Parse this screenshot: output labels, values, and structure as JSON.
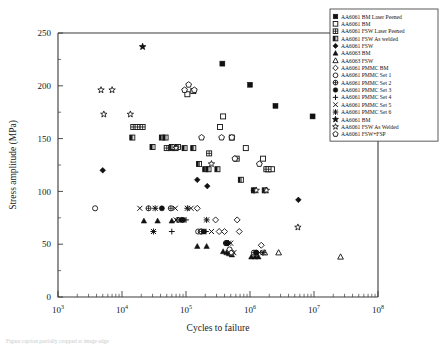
{
  "chart_data": {
    "type": "scatter",
    "title": "",
    "xlabel": "Cycles to failure",
    "ylabel": "Stress amplitude (MPa)",
    "xscale": "log",
    "xlim": [
      1000,
      100000000
    ],
    "ylim": [
      0,
      250
    ],
    "yticks": [
      0,
      50,
      100,
      150,
      200,
      250
    ],
    "yticks_minor": [
      25,
      75,
      125,
      175,
      225
    ],
    "xticks": [
      "10^3",
      "10^4",
      "10^5",
      "10^6",
      "10^7",
      "10^8"
    ],
    "xtick_labels": [
      "10",
      "10",
      "10",
      "10",
      "10",
      "10"
    ],
    "xtick_exponents": [
      "3",
      "4",
      "5",
      "6",
      "7",
      "8"
    ],
    "grid": false,
    "legend_position": "top-right-outside",
    "series": [
      {
        "name": "AA6061 BM Laser Peened",
        "marker": "filled-square",
        "points": [
          [
            370000,
            221
          ],
          [
            1000000,
            201
          ],
          [
            2500000,
            181
          ],
          [
            9500000,
            171
          ]
        ]
      },
      {
        "name": "AA6061 BM",
        "marker": "open-square",
        "points": [
          [
            105000,
            192
          ],
          [
            130000,
            195
          ],
          [
            380000,
            171
          ],
          [
            340000,
            161
          ],
          [
            520000,
            151
          ],
          [
            860000,
            141
          ],
          [
            1600000,
            131
          ],
          [
            1900000,
            121
          ],
          [
            2200000,
            121
          ]
        ]
      },
      {
        "name": "AA6061 FSW Laser Peened",
        "marker": "crosshatch-square",
        "points": [
          [
            15000,
            161
          ],
          [
            17500,
            161
          ],
          [
            21000,
            161
          ],
          [
            50000,
            141
          ],
          [
            58000,
            141
          ],
          [
            68000,
            141
          ],
          [
            230000,
            136
          ],
          [
            620000,
            131
          ],
          [
            1800000,
            121
          ],
          [
            1950000,
            121
          ]
        ]
      },
      {
        "name": "AA6061 FSW As welded",
        "marker": "half-filled-square",
        "points": [
          [
            14500,
            151
          ],
          [
            30000,
            142
          ],
          [
            42000,
            151
          ],
          [
            48000,
            151
          ],
          [
            60000,
            142
          ],
          [
            75000,
            142
          ],
          [
            95000,
            141
          ],
          [
            130000,
            141
          ],
          [
            160000,
            126
          ],
          [
            200000,
            121
          ],
          [
            225000,
            121
          ],
          [
            310000,
            121
          ],
          [
            720000,
            111
          ],
          [
            1150000,
            101
          ],
          [
            1700000,
            101
          ]
        ]
      },
      {
        "name": "AA6061 FSW",
        "marker": "filled-diamond",
        "points": [
          [
            5000,
            120
          ],
          [
            150000,
            111
          ],
          [
            215000,
            105
          ],
          [
            1150000,
            101
          ],
          [
            5700000,
            92
          ]
        ]
      },
      {
        "name": "AA6063 BM",
        "marker": "filled-triangle",
        "points": [
          [
            22000,
            72
          ],
          [
            36000,
            72
          ],
          [
            60000,
            72
          ],
          [
            150000,
            48
          ],
          [
            210000,
            48
          ],
          [
            380000,
            43
          ],
          [
            430000,
            42
          ],
          [
            470000,
            41
          ],
          [
            520000,
            40
          ],
          [
            1050000,
            38
          ],
          [
            1200000,
            38
          ],
          [
            1350000,
            38
          ]
        ]
      },
      {
        "name": "AA6063 FSW",
        "marker": "open-triangle",
        "points": [
          [
            1700000,
            42
          ],
          [
            2800000,
            42
          ],
          [
            26000000,
            38
          ]
        ]
      },
      {
        "name": "AA6061 PMMC BM",
        "marker": "open-diamond",
        "points": [
          [
            150000,
            84
          ],
          [
            630000,
            73
          ],
          [
            680000,
            62
          ],
          [
            1500000,
            49
          ],
          [
            290000,
            73
          ],
          [
            330000,
            62
          ],
          [
            400000,
            62
          ]
        ]
      },
      {
        "name": "AA6061 PMMC Set 1",
        "marker": "open-circle",
        "points": [
          [
            3800,
            84
          ],
          [
            155000,
            62
          ],
          [
            170000,
            62
          ],
          [
            440000,
            51
          ],
          [
            480000,
            45
          ],
          [
            520000,
            42
          ],
          [
            1250000,
            42
          ]
        ]
      },
      {
        "name": "AA6061 PMMC Set 2",
        "marker": "crosshatch-circle",
        "points": [
          [
            26000,
            84
          ],
          [
            58000,
            84
          ],
          [
            75000,
            73
          ],
          [
            175000,
            62
          ],
          [
            420000,
            51
          ],
          [
            1150000,
            42
          ]
        ]
      },
      {
        "name": "AA6061 PMMC Set 3",
        "marker": "filled-circle",
        "points": [
          [
            42000,
            84
          ],
          [
            85000,
            73
          ],
          [
            90000,
            73
          ],
          [
            190000,
            62
          ],
          [
            430000,
            51
          ],
          [
            1250000,
            42
          ]
        ]
      },
      {
        "name": "AA6061 PMMC Set 4",
        "marker": "plus",
        "points": [
          [
            100000,
            73
          ],
          [
            60000,
            62
          ],
          [
            205000,
            62
          ],
          [
            450000,
            51
          ]
        ]
      },
      {
        "name": "AA6061 PMMC Set 5",
        "marker": "cross-x",
        "points": [
          [
            19000,
            84
          ],
          [
            70000,
            73
          ],
          [
            68000,
            84
          ],
          [
            120000,
            84
          ],
          [
            250000,
            62
          ],
          [
            500000,
            51
          ],
          [
            560000,
            42
          ],
          [
            1400000,
            42
          ]
        ]
      },
      {
        "name": "AA6061 PMMC Set 6",
        "marker": "asterisk",
        "points": [
          [
            33000,
            84
          ],
          [
            105000,
            84
          ],
          [
            31000,
            62
          ],
          [
            210000,
            73
          ],
          [
            460000,
            51
          ],
          [
            1600000,
            42
          ]
        ]
      },
      {
        "name": "AA6061 BM",
        "marker": "filled-star",
        "points": [
          [
            21000,
            237
          ]
        ]
      },
      {
        "name": "AA6061 FSW As Welded",
        "marker": "open-star",
        "points": [
          [
            4700,
            196
          ],
          [
            7000,
            196
          ],
          [
            5200,
            173
          ],
          [
            13500,
            173
          ],
          [
            70000,
            141
          ],
          [
            250000,
            126
          ],
          [
            1250000,
            101
          ],
          [
            1800000,
            101
          ],
          [
            5600000,
            66
          ]
        ]
      },
      {
        "name": "AA6061 FSW+FSP",
        "marker": "open-pentagon",
        "points": [
          [
            95000,
            196
          ],
          [
            110000,
            201
          ],
          [
            135000,
            196
          ],
          [
            175000,
            151
          ],
          [
            360000,
            151
          ],
          [
            520000,
            151
          ],
          [
            1400000,
            126
          ],
          [
            580000,
            131
          ]
        ]
      }
    ]
  },
  "legend": {
    "items": [
      {
        "marker": "filled-square",
        "label": "AA6061 BM Laser Peened"
      },
      {
        "marker": "open-square",
        "label": "AA6061 BM"
      },
      {
        "marker": "crosshatch-square",
        "label": "AA6061 FSW Laser Peened"
      },
      {
        "marker": "half-filled-square",
        "label": "AA6061 FSW As welded"
      },
      {
        "marker": "filled-diamond",
        "label": "AA6061 FSW"
      },
      {
        "marker": "filled-triangle",
        "label": "AA6063 BM"
      },
      {
        "marker": "open-triangle",
        "label": "AA6063 FSW"
      },
      {
        "marker": "open-diamond",
        "label": "AA6061 PMMC BM"
      },
      {
        "marker": "open-circle",
        "label": "AA6061 PMMC Set 1"
      },
      {
        "marker": "crosshatch-circle",
        "label": "AA6061 PMMC Set 2"
      },
      {
        "marker": "filled-circle",
        "label": "AA6061 PMMC Set 3"
      },
      {
        "marker": "plus",
        "label": "AA6061 PMMC Set 4"
      },
      {
        "marker": "cross-x",
        "label": "AA6061 PMMC Set 5"
      },
      {
        "marker": "asterisk",
        "label": "AA6061 PMMC Set 6"
      },
      {
        "marker": "filled-star",
        "label": "AA6061 BM"
      },
      {
        "marker": "open-star",
        "label": "AA6061 FSW As Welded"
      },
      {
        "marker": "open-pentagon",
        "label": "AA6061 FSW+FSP"
      }
    ]
  },
  "caption": {
    "text": "Figure caption partially cropped at image edge"
  },
  "colors": {
    "marker": "#111111",
    "axis": "#3a3a3a",
    "background": "#ffffff"
  }
}
